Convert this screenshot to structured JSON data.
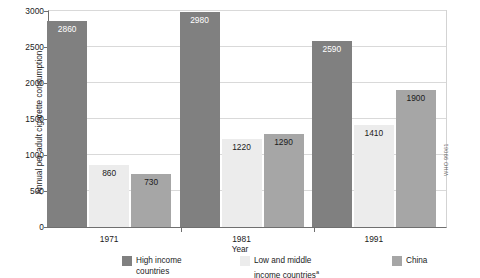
{
  "chart_data": {
    "type": "bar",
    "title": "",
    "xlabel": "Year",
    "ylabel": "Annual per adult cigarette consumption",
    "categories": [
      "1971",
      "1981",
      "1991"
    ],
    "ylim": [
      0,
      3000
    ],
    "yticks": [
      0,
      500,
      1000,
      1500,
      2000,
      2500,
      3000
    ],
    "ytick_labels": [
      "0",
      "500",
      "1000",
      "1500",
      "2000",
      "2500",
      "3000"
    ],
    "grid": true,
    "legend_position": "bottom",
    "series": [
      {
        "name": "High income countries",
        "color": "#808080",
        "label_color": "#ffffff",
        "values": [
          2860,
          2980,
          2590
        ]
      },
      {
        "name": "Low and middle income countries",
        "name_superscript": "a",
        "color": "#ececec",
        "label_color": "#1b1b1b",
        "values": [
          860,
          1220,
          1410
        ]
      },
      {
        "name": "China",
        "color": "#a6a6a6",
        "label_color": "#1b1b1b",
        "values": [
          730,
          1290,
          1900
        ]
      }
    ],
    "data_labels": [
      "2860",
      "860",
      "730",
      "2980",
      "1220",
      "1290",
      "2590",
      "1410",
      "1900"
    ]
  },
  "axes": {
    "y_title": "Annual per adult cigarette consumption",
    "x_title": "Year",
    "y_ticks": [
      "3000",
      "2500",
      "2000",
      "1500",
      "1000",
      "500",
      "0"
    ],
    "x_ticks": [
      "1971",
      "1981",
      "1991"
    ]
  },
  "legend": {
    "items": [
      {
        "label": "High income\ncountries",
        "superscript": "",
        "color": "#808080"
      },
      {
        "label": "Low and middle\nincome countries",
        "superscript": "a",
        "color": "#ececec"
      },
      {
        "label": "China",
        "superscript": "",
        "color": "#a6a6a6"
      }
    ]
  },
  "source": {
    "note": "WHO 99061"
  },
  "colors": {
    "high_income": "#808080",
    "low_middle_income": "#ececec",
    "china": "#a6a6a6",
    "axis": "#6f6f6f",
    "grid": "#d9d9d9",
    "text": "#1b1b1b"
  }
}
